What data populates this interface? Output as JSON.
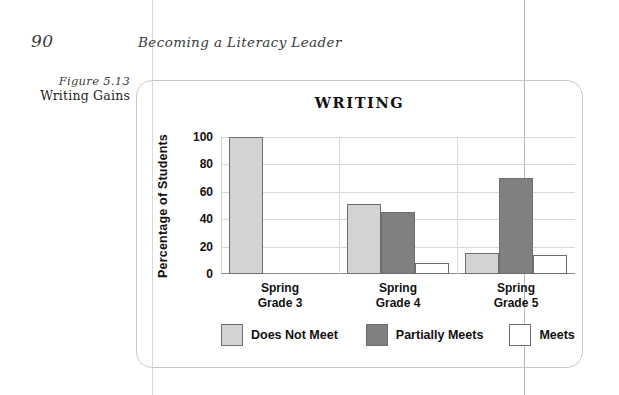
{
  "page": {
    "number": "90",
    "running_head": "Becoming a Literacy Leader"
  },
  "figure": {
    "number_label": "Figure 5.13",
    "title": "Writing Gains"
  },
  "chart_data": {
    "type": "bar",
    "title": "WRITING",
    "xlabel": "",
    "ylabel": "Percentage of Students",
    "ylim": [
      0,
      100
    ],
    "yticks": [
      0,
      20,
      40,
      60,
      80,
      100
    ],
    "ytick_labels": [
      "0",
      "20",
      "40",
      "60",
      "80",
      "100"
    ],
    "grid": true,
    "legend_position": "bottom",
    "categories": [
      "Spring Grade 3",
      "Spring Grade 4",
      "Spring Grade 5"
    ],
    "category_lines": [
      [
        "Spring",
        "Grade 3"
      ],
      [
        "Spring",
        "Grade 4"
      ],
      [
        "Spring",
        "Grade 5"
      ]
    ],
    "series": [
      {
        "name": "Does Not Meet",
        "color": "#d3d3d3",
        "values": [
          100,
          51,
          15
        ]
      },
      {
        "name": "Partially Meets",
        "color": "#808080",
        "values": [
          0,
          45,
          70
        ]
      },
      {
        "name": "Meets",
        "color": "#ffffff",
        "values": [
          0,
          8,
          14
        ]
      }
    ]
  },
  "colors": {
    "does_not_meet": "#d3d3d3",
    "partially_meets": "#808080",
    "meets": "#ffffff",
    "bar_outline": "#6d6d6d",
    "grid": "#d9d9d9",
    "box_border": "#c9c9c9"
  }
}
